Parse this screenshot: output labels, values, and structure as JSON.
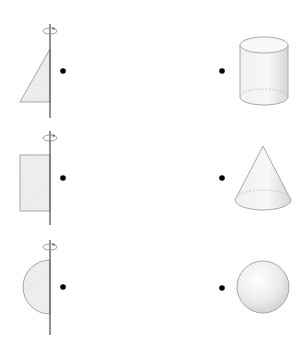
{
  "diagram": {
    "type": "matching-exercise",
    "colors": {
      "background": "#ffffff",
      "fill": "#eeeeee",
      "stroke": "#9a9a9a",
      "axis": "#555555",
      "dot": "#000000"
    },
    "left_column": [
      {
        "id": "triangle",
        "label": "right triangle rotated about axis"
      },
      {
        "id": "rectangle",
        "label": "rectangle rotated about axis"
      },
      {
        "id": "semicircle",
        "label": "semicircle rotated about axis"
      }
    ],
    "right_column": [
      {
        "id": "cylinder",
        "label": "cylinder"
      },
      {
        "id": "cone",
        "label": "cone"
      },
      {
        "id": "sphere",
        "label": "sphere"
      }
    ]
  }
}
